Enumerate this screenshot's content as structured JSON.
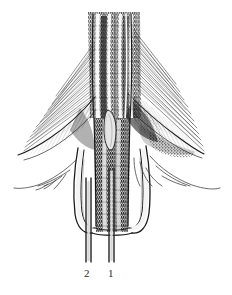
{
  "figure": {
    "type": "anatomical-line-drawing",
    "style": "engraving / hatched pen-and-ink",
    "background_color": "#ffffff",
    "ink_color": "#1a1a1a",
    "width": 232,
    "height": 295,
    "labels": [
      {
        "id": "label-2",
        "text": "2",
        "x": 88,
        "y": 273,
        "leader_x": 88
      },
      {
        "id": "label-1",
        "text": "1",
        "x": 112,
        "y": 273,
        "leader_x": 112
      }
    ],
    "parts": {
      "central_canal": "dark vertically striated midline canal",
      "lamellae": "radiating hatched wing-like flanks",
      "bulb": "pale teardrop body in the midline",
      "sheath": "inverted U-shaped basal sheath",
      "probe_left": "thin probe marked 2",
      "probe_right": "thin probe marked 1",
      "wisp_left": "fine branching filament sweeping down-left",
      "wisp_right": "fine branching filament sweeping down-right"
    }
  }
}
